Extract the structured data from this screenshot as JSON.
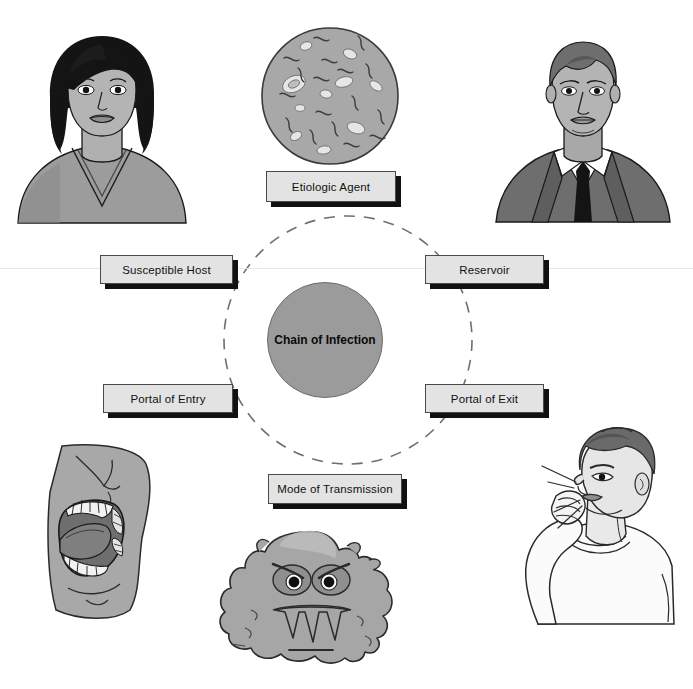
{
  "diagram": {
    "title": "Chain of Infection",
    "center": {
      "label": "Chain of Infection",
      "fill": "#9b9b9b",
      "cx": 324,
      "cy": 339,
      "r": 57
    },
    "ring": {
      "cx": 348,
      "cy": 340,
      "r": 124,
      "style": "dashed",
      "color": "#6f6f6f"
    },
    "nodes": [
      {
        "id": "etiologic-agent",
        "label": "Etiologic Agent",
        "x": 266,
        "y": 171,
        "w": 130,
        "h": 31
      },
      {
        "id": "reservoir",
        "label": "Reservoir",
        "x": 425,
        "y": 255,
        "w": 119,
        "h": 29
      },
      {
        "id": "portal-of-exit",
        "label": "Portal of Exit",
        "x": 425,
        "y": 384,
        "w": 119,
        "h": 29
      },
      {
        "id": "mode-of-transmission",
        "label": "Mode of Transmission",
        "x": 268,
        "y": 474,
        "w": 134,
        "h": 30
      },
      {
        "id": "portal-of-entry",
        "label": "Portal of Entry",
        "x": 103,
        "y": 384,
        "w": 130,
        "h": 29
      },
      {
        "id": "susceptible-host",
        "label": "Susceptible Host",
        "x": 100,
        "y": 255,
        "w": 133,
        "h": 29
      }
    ],
    "illustrations": [
      {
        "id": "woman-portrait",
        "name": "susceptible host illustration",
        "caption": "Woman with dark bob haircut wearing a V-neck shirt"
      },
      {
        "id": "petri-microbes",
        "name": "etiologic agent illustration",
        "caption": "Microscope field of view showing rod-shaped bacteria and cells"
      },
      {
        "id": "man-in-suit",
        "name": "reservoir illustration",
        "caption": "Man in a suit and tie"
      },
      {
        "id": "open-mouth",
        "name": "portal of entry illustration",
        "caption": "Profile of an open mouth showing teeth and tongue"
      },
      {
        "id": "cartoon-germ",
        "name": "mode of transmission illustration",
        "caption": "Cartoon germ blob with angry eyes and jagged teeth"
      },
      {
        "id": "coughing-man",
        "name": "portal of exit illustration",
        "caption": "Man coughing into his hand"
      }
    ],
    "palette": {
      "background": "#ffffff",
      "box_fill": "#e3e3e3",
      "box_border": "#4a4a4a",
      "box_shadow": "#111111",
      "hub_fill": "#9b9b9b",
      "ink": "#1a1a1a",
      "skin": "#b4b4b4",
      "mid_gray": "#9a9a9a",
      "dark_gray": "#6a6a6a",
      "hair_black": "#141414"
    }
  }
}
